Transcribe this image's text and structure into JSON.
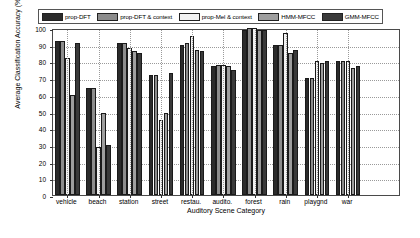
{
  "chart_data": {
    "type": "bar",
    "title": "",
    "xlabel": "Auditory Scene Category",
    "ylabel": "Average Classification Accuracy (%)",
    "ylim": [
      0,
      100
    ],
    "ytick_labels": [
      "0",
      "10",
      "20",
      "30",
      "40",
      "50",
      "60",
      "70",
      "80",
      "90",
      "100"
    ],
    "grid": true,
    "legend_position": "top",
    "categories": [
      "vehicle",
      "beach",
      "station",
      "street",
      "restau.",
      "audito.",
      "forest",
      "rain",
      "playgnd",
      "war"
    ],
    "series": [
      {
        "name": "prop-DFT",
        "color": "#2b2b2b",
        "values": [
          92,
          64,
          91,
          72,
          90,
          77,
          99,
          90,
          70,
          80
        ]
      },
      {
        "name": "prop-DFT & context",
        "color": "#8c8c8c",
        "values": [
          92,
          64,
          91,
          72,
          91,
          78,
          100,
          90,
          70,
          80
        ]
      },
      {
        "name": "prop-Mel & context",
        "color": "#f2f2f2",
        "values": [
          82,
          29,
          88,
          45,
          95,
          78,
          100,
          97,
          80,
          80
        ]
      },
      {
        "name": "HMM-MFCC",
        "color": "#9e9e9e",
        "values": [
          60,
          49,
          86,
          49,
          87,
          77,
          99,
          85,
          79,
          76
        ]
      },
      {
        "name": "GMM-MFCC",
        "color": "#3a3a3a",
        "values": [
          91,
          30,
          85,
          73,
          86,
          75,
          99,
          87,
          80,
          77
        ]
      }
    ]
  }
}
